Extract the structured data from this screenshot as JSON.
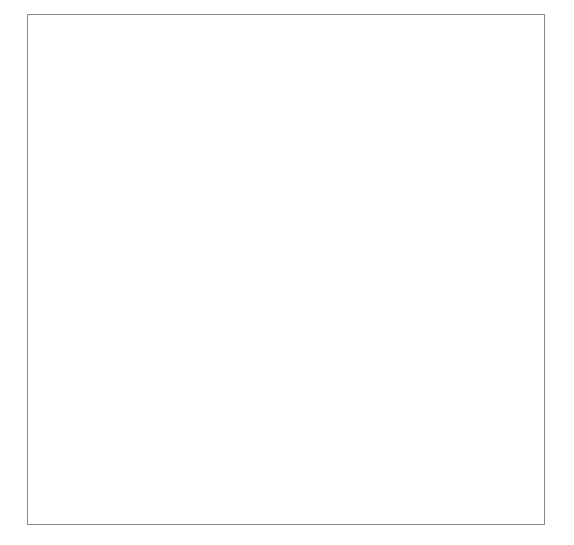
{
  "diagram": {
    "colors": {
      "orange_column": "#e8a464",
      "badge_navy": "#1b3f86",
      "ellipse_cream": "#f6ecdc",
      "background_sage": "#9bb3a8",
      "red_arrow": "#cc2222",
      "blue_ring": "#20459a",
      "memory_text_red": "#e03a2f",
      "chip_lavender": "#b7b6e2",
      "teal_line": "#4a7fa0"
    }
  },
  "columns": {
    "left_title": "Instruction cycle",
    "right_title": "Execution cycle"
  },
  "steps": [
    {
      "number": "1",
      "line1": "The control unit",
      "line2": "fetches the next",
      "line3": "instruction from",
      "line4": "memory",
      "sub": "(C = A × B)"
    },
    {
      "number": "2",
      "line1": "The instruction",
      "line2": "is decoded",
      "line3": "",
      "line4": "",
      "sub": ""
    },
    {
      "number": "3",
      "line1": "The ALU",
      "line2": "executes the",
      "line3": "instruction",
      "line4": "",
      "sub": ""
    },
    {
      "number": "4",
      "line1": "The result is",
      "line2": "written to",
      "line3": "memory",
      "line4": "",
      "sub": ""
    }
  ],
  "memory": {
    "title": "Memory",
    "program": [
      "INPUT A B",
      "C = A × B"
    ],
    "variable_labels": [
      "A",
      "B",
      "C"
    ],
    "values": [
      "3",
      "6",
      "18"
    ]
  },
  "cpu": {
    "title": "CPU",
    "control_unit": "Control\nunit",
    "control_unit_l1": "Control",
    "control_unit_l2": "unit",
    "alu_l1": "Arithmetic",
    "alu_l2": "logic unit",
    "operand_a": "3",
    "operator": "×",
    "operand_b": "6",
    "equals": "=",
    "result": "18"
  },
  "arrows": {
    "fetch_down_label": "red-arrow-down-left",
    "writeback_up_label": "red-arrow-up-right",
    "operand_a_label": "salmon-arrow-memory-to-alu",
    "operand_b_label": "teal-arrow-memory-to-alu",
    "result_label": "orange-arrow-alu-to-memory"
  }
}
